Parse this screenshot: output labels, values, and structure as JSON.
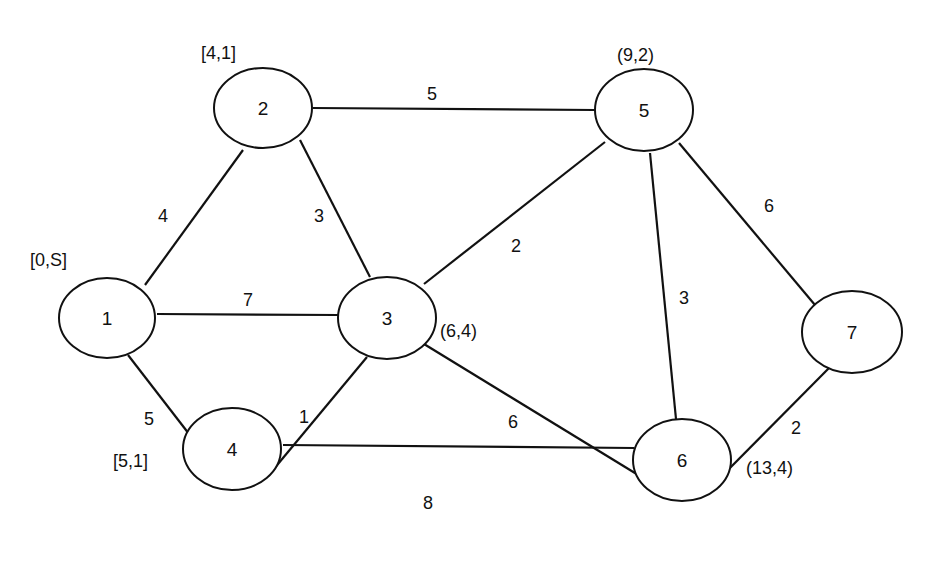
{
  "graph": {
    "type": "weighted-undirected-graph",
    "nodes": [
      {
        "id": "1",
        "label": "1",
        "cx": 107,
        "cy": 318,
        "rx": 48,
        "ry": 40,
        "annotation": "[0,S]",
        "ax": 30,
        "ay": 260
      },
      {
        "id": "2",
        "label": "2",
        "cx": 263,
        "cy": 108,
        "rx": 49,
        "ry": 40,
        "annotation": "[4,1]",
        "ax": 201,
        "ay": 53
      },
      {
        "id": "3",
        "label": "3",
        "cx": 387,
        "cy": 318,
        "rx": 49,
        "ry": 41,
        "annotation": "(6,4)",
        "ax": 440,
        "ay": 331
      },
      {
        "id": "4",
        "label": "4",
        "cx": 232,
        "cy": 449,
        "rx": 49,
        "ry": 41,
        "annotation": "[5,1]",
        "ax": 113,
        "ay": 461
      },
      {
        "id": "5",
        "label": "5",
        "cx": 644,
        "cy": 110,
        "rx": 49,
        "ry": 41,
        "annotation": "(9,2)",
        "ax": 617,
        "ay": 55
      },
      {
        "id": "6",
        "label": "6",
        "cx": 682,
        "cy": 460,
        "rx": 49,
        "ry": 41,
        "annotation": "(13,4)",
        "ax": 746,
        "ay": 468
      },
      {
        "id": "7",
        "label": "7",
        "cx": 852,
        "cy": 332,
        "rx": 50,
        "ry": 41,
        "annotation": "",
        "ax": 0,
        "ay": 0
      }
    ],
    "edges": [
      {
        "from": "1",
        "to": "2",
        "weight": "4",
        "x1": 145,
        "y1": 285,
        "x2": 243,
        "y2": 150,
        "lx": 163,
        "ly": 216
      },
      {
        "from": "1",
        "to": "3",
        "weight": "7",
        "x1": 157,
        "y1": 314,
        "x2": 339,
        "y2": 315,
        "lx": 248,
        "ly": 300
      },
      {
        "from": "1",
        "to": "4",
        "weight": "5",
        "x1": 128,
        "y1": 355,
        "x2": 213,
        "y2": 465,
        "lx": 149,
        "ly": 419
      },
      {
        "from": "2",
        "to": "3",
        "weight": "3",
        "x1": 300,
        "y1": 140,
        "x2": 370,
        "y2": 277,
        "lx": 319,
        "ly": 216
      },
      {
        "from": "2",
        "to": "5",
        "weight": "5",
        "x1": 313,
        "y1": 108,
        "x2": 595,
        "y2": 110,
        "lx": 432,
        "ly": 94
      },
      {
        "from": "3",
        "to": "4",
        "weight": "1",
        "x1": 367,
        "y1": 357,
        "x2": 268,
        "y2": 476,
        "lx": 304,
        "ly": 417
      },
      {
        "from": "3",
        "to": "5",
        "weight": "2",
        "x1": 424,
        "y1": 284,
        "x2": 605,
        "y2": 142,
        "lx": 516,
        "ly": 246
      },
      {
        "from": "3",
        "to": "6",
        "weight": "6",
        "x1": 424,
        "y1": 344,
        "x2": 648,
        "y2": 481,
        "lx": 513,
        "ly": 422
      },
      {
        "from": "4",
        "to": "6",
        "weight": "8",
        "x1": 283,
        "y1": 445,
        "x2": 634,
        "y2": 448,
        "lx": 428,
        "ly": 503
      },
      {
        "from": "5",
        "to": "6",
        "weight": "3",
        "x1": 650,
        "y1": 153,
        "x2": 676,
        "y2": 419,
        "lx": 684,
        "ly": 298
      },
      {
        "from": "5",
        "to": "7",
        "weight": "6",
        "x1": 679,
        "y1": 143,
        "x2": 815,
        "y2": 305,
        "lx": 769,
        "ly": 206
      },
      {
        "from": "6",
        "to": "7",
        "weight": "2",
        "x1": 719,
        "y1": 479,
        "x2": 831,
        "y2": 366,
        "lx": 796,
        "ly": 428
      }
    ]
  }
}
